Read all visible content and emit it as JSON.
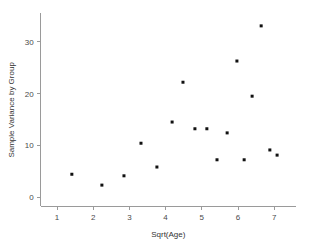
{
  "chart_data": {
    "type": "scatter",
    "title": "",
    "xlabel": "Sqrt(Age)",
    "ylabel": "Sample Variance by Group",
    "xlim": [
      0.55,
      7.6
    ],
    "ylim": [
      -1.8,
      35.5
    ],
    "grid": false,
    "legend": null,
    "xticks": [
      1,
      2,
      3,
      4,
      5,
      6,
      7
    ],
    "xtick_labels": [
      "1",
      "2",
      "3",
      "4",
      "5",
      "6",
      "7"
    ],
    "yticks": [
      0,
      10,
      20,
      30
    ],
    "ytick_labels": [
      "0",
      "10",
      "20",
      "30"
    ],
    "marker": "filled-square",
    "marker_color": "#111111",
    "marker_size": 3,
    "points": [
      {
        "x": 1.41,
        "y": 4.4
      },
      {
        "x": 2.24,
        "y": 2.3
      },
      {
        "x": 2.85,
        "y": 4.1
      },
      {
        "x": 3.32,
        "y": 10.4
      },
      {
        "x": 3.76,
        "y": 5.8
      },
      {
        "x": 4.18,
        "y": 14.5
      },
      {
        "x": 4.48,
        "y": 22.2
      },
      {
        "x": 4.81,
        "y": 13.2
      },
      {
        "x": 5.14,
        "y": 13.2
      },
      {
        "x": 5.42,
        "y": 7.2
      },
      {
        "x": 5.7,
        "y": 12.4
      },
      {
        "x": 5.97,
        "y": 26.3
      },
      {
        "x": 6.17,
        "y": 7.2
      },
      {
        "x": 6.39,
        "y": 19.5
      },
      {
        "x": 6.64,
        "y": 33.1
      },
      {
        "x": 6.88,
        "y": 9.1
      },
      {
        "x": 7.08,
        "y": 8.1
      }
    ]
  },
  "colors": {
    "axis": "#9a9a9a",
    "tick_text": "#4a4a4a",
    "title_text": "#333333",
    "marker": "#111111",
    "background": "#ffffff"
  }
}
